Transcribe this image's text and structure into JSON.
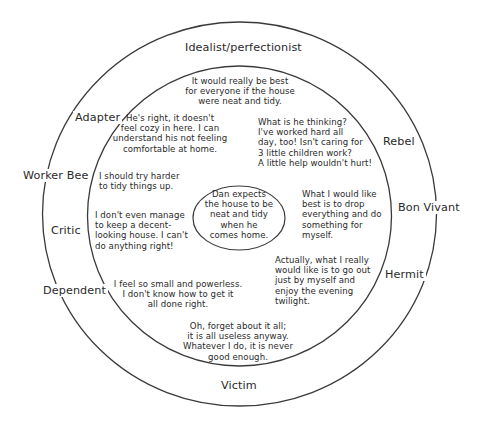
{
  "diagram": {
    "center_statement": "Dan expects\nthe house to be\nneat and tidy\nwhen he\ncomes home.",
    "roles": {
      "top": "Idealist/perfectionist",
      "adapter": "Adapter",
      "rebel": "Rebel",
      "worker_bee": "Worker Bee",
      "bon_vivant": "Bon Vivant",
      "critic": "Critic",
      "hermit": "Hermit",
      "dependent": "Dependent",
      "bottom": "Victim"
    },
    "thoughts": {
      "idealist": "It would really be best\nfor everyone if the house\nwere neat and tidy.",
      "adapter": "He's right, it doesn't\nfeel cozy in here. I can\nunderstand his not feeling\ncomfortable at home.",
      "rebel": "What is he thinking?\nI've worked hard all\nday, too! Isn't caring for\n3 little children work?\nA little help wouldn't hurt!",
      "worker_bee": "I should try harder\nto tidy things up.",
      "critic": "I don't even manage\nto keep a decent-\nlooking house. I can't\ndo anything right!",
      "bon_vivant": "What I would like\nbest is to drop\neverything and do\nsomething for\nmyself.",
      "hermit": "Actually, what I really\nwould like is to go out\njust by myself and\nenjoy the evening\ntwilight.",
      "dependent": "I feel so small and powerless.\nI don't know how to get it\nall done right.",
      "victim": "Oh, forget about it all;\nit is all useless anyway.\nWhatever I do, it is never\ngood enough."
    },
    "colors": {
      "line": "#3a3a3a",
      "text": "#2a2a2a",
      "background": "#ffffff"
    }
  }
}
